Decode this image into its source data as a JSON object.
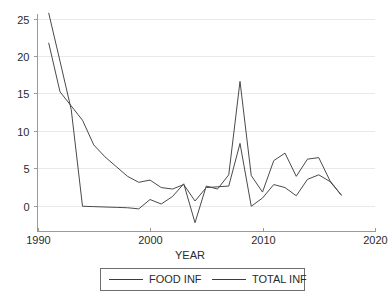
{
  "chart_data": {
    "type": "line",
    "title": "",
    "xlabel": "YEAR",
    "ylabel": "",
    "xlim": [
      1990,
      2020
    ],
    "ylim": [
      -3.5,
      27
    ],
    "grid": true,
    "legend_position": "bottom",
    "x_ticks": [
      "1990",
      "2000",
      "2010",
      "2020"
    ],
    "x_tick_values": [
      1990,
      2000,
      2010,
      2020
    ],
    "y_ticks": [
      "0",
      "5",
      "10",
      "15",
      "20",
      "25"
    ],
    "y_tick_values": [
      0,
      5,
      10,
      15,
      20,
      25
    ],
    "x": [
      1991,
      1992,
      1993,
      1994,
      1995,
      1996,
      1997,
      1998,
      1999,
      2000,
      2001,
      2002,
      2003,
      2004,
      2005,
      2006,
      2007,
      2008,
      2009,
      2010,
      2011,
      2012,
      2013,
      2014,
      2015,
      2016,
      2017
    ],
    "series": [
      {
        "name": "FOOD INF",
        "values": [
          25.7,
          19.3,
          12.8,
          -0.1,
          -0.15,
          -0.2,
          -0.25,
          -0.3,
          -0.45,
          0.8,
          0.2,
          1.2,
          2.9,
          -2.3,
          2.6,
          2.2,
          4.1,
          16.6,
          4.0,
          1.8,
          6.0,
          7.0,
          3.9,
          6.2,
          6.4,
          3.3,
          1.4
        ]
      },
      {
        "name": "TOTAL INF",
        "values": [
          21.7,
          15.2,
          13.3,
          11.4,
          8.1,
          6.5,
          5.2,
          3.9,
          3.1,
          3.4,
          2.4,
          2.2,
          2.8,
          0.6,
          2.4,
          2.5,
          2.6,
          8.3,
          -0.1,
          1.0,
          2.8,
          2.4,
          1.3,
          3.5,
          4.1,
          3.2,
          1.4
        ]
      }
    ]
  },
  "legend": {
    "entries": [
      {
        "label": "FOOD INF"
      },
      {
        "label": "TOTAL INF"
      }
    ]
  },
  "axes": {
    "x_title": "YEAR"
  },
  "colors": {
    "series_stroke": "#4a4a4a",
    "grid": "#e9e9e9",
    "axis": "#9a9a9a",
    "background": "#ffffff"
  }
}
